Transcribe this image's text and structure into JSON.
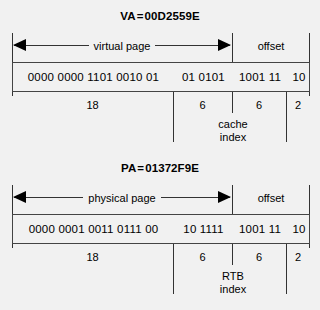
{
  "background_color": "#f1f1f1",
  "line_color": "#333333",
  "text_color": "#000000",
  "diagrams": [
    {
      "id": "va",
      "title_prefix": "VA",
      "title_equals": "=",
      "title_value": "00D2559E",
      "spans": [
        {
          "label": "virtual page",
          "arrows": true
        },
        {
          "label": "offset",
          "arrows": false
        }
      ],
      "bit_groups": [
        "0000 0000 1101 0010 01",
        "01 0101",
        "1001 11",
        "10"
      ],
      "widths": [
        "18",
        "6",
        "6",
        "2"
      ],
      "caption_line1": "cache",
      "caption_line2": "index"
    },
    {
      "id": "pa",
      "title_prefix": "PA",
      "title_equals": "=",
      "title_value": "01372F9E",
      "spans": [
        {
          "label": "physical page",
          "arrows": true
        },
        {
          "label": "offset",
          "arrows": false
        }
      ],
      "bit_groups": [
        "0000 0001 0011 0111 00",
        "10 1111",
        "1001 11",
        "10"
      ],
      "widths": [
        "18",
        "6",
        "6",
        "2"
      ],
      "caption_line1": "RTB",
      "caption_line2": "index"
    }
  ]
}
